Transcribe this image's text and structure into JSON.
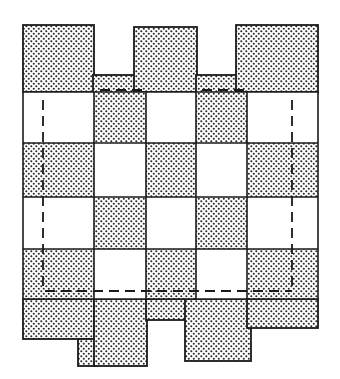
{
  "diagram": {
    "colors": {
      "background": "#ffffff",
      "stroke": "#1a1a1a",
      "dot": "#2a2a2a",
      "shaded_base": "#ffffff"
    },
    "grid": {
      "columns_x": [
        23,
        94,
        146,
        196,
        247,
        318
      ],
      "rows_y": [
        92,
        143,
        197,
        249,
        299
      ]
    },
    "checker_rows": [
      [
        "white",
        "shaded",
        "white",
        "shaded",
        "white"
      ],
      [
        "shaded",
        "white",
        "shaded",
        "white",
        "shaded"
      ],
      [
        "white",
        "shaded",
        "white",
        "shaded",
        "white"
      ],
      [
        "shaded",
        "white",
        "shaded",
        "white",
        "shaded"
      ]
    ],
    "top_flaps": [
      {
        "name": "col1-top",
        "x": 23,
        "y": 25,
        "w": 71,
        "h": 67
      },
      {
        "name": "col2-top",
        "x": 93,
        "y": 75,
        "w": 53,
        "h": 68
      },
      {
        "name": "col3-top",
        "x": 134,
        "y": 27,
        "w": 63,
        "h": 65
      },
      {
        "name": "col4-top",
        "x": 196,
        "y": 75,
        "w": 52,
        "h": 68
      },
      {
        "name": "col5-top",
        "x": 236,
        "y": 25,
        "w": 82,
        "h": 67
      }
    ],
    "bottom_flaps": [
      {
        "name": "col1-bottom",
        "x": 23,
        "y": 299,
        "w": 71,
        "h": 40
      },
      {
        "name": "col1-stub",
        "x": 78,
        "y": 339,
        "w": 18,
        "h": 27
      },
      {
        "name": "col2-bottom",
        "x": 94,
        "y": 299,
        "w": 53,
        "h": 67
      },
      {
        "name": "col3-bottom",
        "x": 146,
        "y": 299,
        "w": 50,
        "h": 21
      },
      {
        "name": "col4-bottom",
        "x": 185,
        "y": 299,
        "w": 66,
        "h": 62
      },
      {
        "name": "col5-bottom",
        "x": 247,
        "y": 299,
        "w": 71,
        "h": 29
      }
    ],
    "dashed_outline": {
      "left_x": 43,
      "right_x": 292,
      "top_y": 92,
      "bottom_y": 299,
      "note": "fold lines inset within the outer columns"
    }
  }
}
